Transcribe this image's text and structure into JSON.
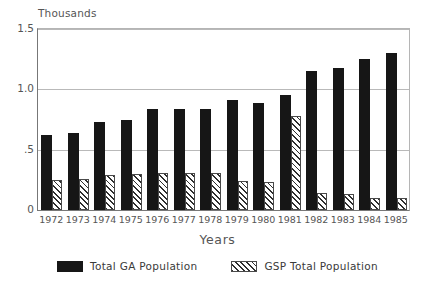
{
  "chart_data": {
    "type": "bar",
    "title": "",
    "subtitle": "",
    "unit_label": "Thousands",
    "xlabel": "Years",
    "ylabel": "",
    "ylim": [
      0,
      1.5
    ],
    "yticks": [
      0,
      0.5,
      1.0,
      1.5
    ],
    "ytick_labels": [
      "0",
      ".5",
      "1.0",
      "1.5"
    ],
    "grid": true,
    "legend_position": "bottom",
    "categories": [
      "1972",
      "1973",
      "1974",
      "1975",
      "1976",
      "1977",
      "1978",
      "1979",
      "1980",
      "1981",
      "1982",
      "1983",
      "1984",
      "1985"
    ],
    "series": [
      {
        "name": "Total GA Population",
        "fill": "solid",
        "color": "#161616",
        "values": [
          0.62,
          0.64,
          0.73,
          0.75,
          0.84,
          0.84,
          0.84,
          0.91,
          0.89,
          0.95,
          1.15,
          1.18,
          1.25,
          1.3
        ]
      },
      {
        "name": "GSP Total Population",
        "fill": "hatched",
        "color": "#2f2f2f",
        "values": [
          0.25,
          0.26,
          0.29,
          0.3,
          0.31,
          0.31,
          0.31,
          0.24,
          0.23,
          0.78,
          0.14,
          0.13,
          0.1,
          0.1
        ]
      }
    ]
  },
  "legend": {
    "entries": [
      {
        "label": "Total GA Population"
      },
      {
        "label": "GSP Total Population"
      }
    ]
  }
}
